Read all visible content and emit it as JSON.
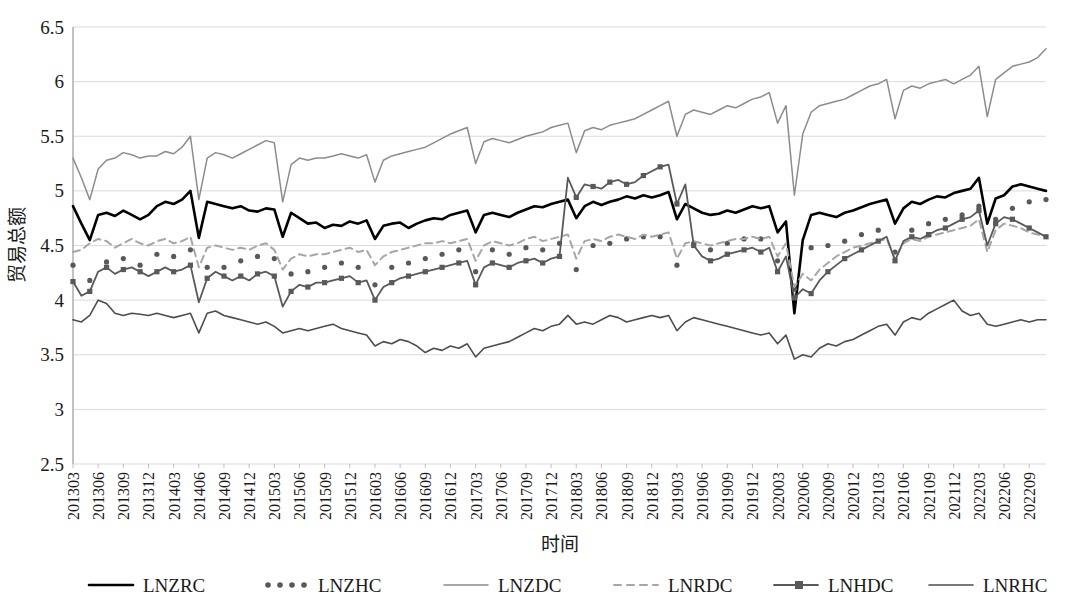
{
  "chart_data": {
    "type": "line",
    "title": "",
    "xlabel": "时间",
    "ylabel": "贸易总额",
    "ylim": [
      2.5,
      6.5
    ],
    "ytick_labels": [
      "6.5",
      "6",
      "5.5",
      "5",
      "4.5",
      "4",
      "3.5",
      "3",
      "2.5"
    ],
    "ytick_values": [
      6.5,
      6,
      5.5,
      5,
      4.5,
      4,
      3.5,
      3,
      2.5
    ],
    "grid": true,
    "legend_position": "bottom",
    "x_tick_labels": [
      "201303",
      "201306",
      "201309",
      "201312",
      "201403",
      "201406",
      "201409",
      "201412",
      "201503",
      "201506",
      "201509",
      "201512",
      "201603",
      "201606",
      "201609",
      "201612",
      "201703",
      "201706",
      "201709",
      "201712",
      "201803",
      "201806",
      "201809",
      "201812",
      "201903",
      "201906",
      "201909",
      "201912",
      "202003",
      "202006",
      "202009",
      "202012",
      "202103",
      "202106",
      "202109",
      "202112",
      "202203",
      "202206",
      "202209"
    ],
    "x_tick_step_months": 3,
    "x_start": "201303",
    "x_end": "202211",
    "n_points": 117,
    "series": [
      {
        "name": "LNZRC",
        "color": "#000000",
        "style": "solid",
        "width": 2.6,
        "marker": "none",
        "values": [
          4.86,
          4.7,
          4.55,
          4.78,
          4.8,
          4.77,
          4.82,
          4.78,
          4.74,
          4.78,
          4.86,
          4.9,
          4.88,
          4.92,
          5.0,
          4.57,
          4.9,
          4.88,
          4.86,
          4.84,
          4.86,
          4.82,
          4.81,
          4.84,
          4.83,
          4.58,
          4.8,
          4.75,
          4.7,
          4.71,
          4.66,
          4.69,
          4.68,
          4.72,
          4.7,
          4.73,
          4.56,
          4.68,
          4.7,
          4.71,
          4.66,
          4.7,
          4.73,
          4.75,
          4.74,
          4.78,
          4.8,
          4.82,
          4.62,
          4.78,
          4.8,
          4.78,
          4.76,
          4.8,
          4.83,
          4.86,
          4.85,
          4.88,
          4.9,
          4.92,
          4.75,
          4.86,
          4.9,
          4.87,
          4.9,
          4.92,
          4.95,
          4.93,
          4.96,
          4.94,
          4.96,
          4.99,
          4.74,
          4.88,
          4.84,
          4.8,
          4.78,
          4.79,
          4.82,
          4.8,
          4.83,
          4.86,
          4.84,
          4.86,
          4.62,
          4.72,
          3.88,
          4.55,
          4.78,
          4.8,
          4.78,
          4.76,
          4.8,
          4.82,
          4.85,
          4.88,
          4.9,
          4.92,
          4.7,
          4.84,
          4.9,
          4.88,
          4.92,
          4.95,
          4.94,
          4.98,
          5.0,
          5.02,
          5.12,
          4.7,
          4.93,
          4.96,
          5.04,
          5.06,
          5.04,
          5.02,
          5.0
        ]
      },
      {
        "name": "LNZHC",
        "color": "#595959",
        "style": "dotted",
        "width": 4.2,
        "marker": "dot",
        "values": [
          4.32,
          4.2,
          4.18,
          4.36,
          4.35,
          4.3,
          4.38,
          4.36,
          4.32,
          4.38,
          4.42,
          4.44,
          4.4,
          4.42,
          4.46,
          4.12,
          4.3,
          4.35,
          4.3,
          4.32,
          4.36,
          4.34,
          4.4,
          4.42,
          4.38,
          4.12,
          4.24,
          4.28,
          4.26,
          4.3,
          4.3,
          4.32,
          4.34,
          4.36,
          4.3,
          4.32,
          4.14,
          4.26,
          4.3,
          4.36,
          4.34,
          4.36,
          4.38,
          4.4,
          4.42,
          4.44,
          4.46,
          4.48,
          4.26,
          4.42,
          4.46,
          4.44,
          4.42,
          4.46,
          4.48,
          4.5,
          4.46,
          4.5,
          4.52,
          4.54,
          4.28,
          4.46,
          4.5,
          4.48,
          4.52,
          4.54,
          4.56,
          4.54,
          4.58,
          4.56,
          4.58,
          4.6,
          4.32,
          4.48,
          4.52,
          4.5,
          4.46,
          4.48,
          4.52,
          4.54,
          4.56,
          4.58,
          4.56,
          4.58,
          4.36,
          4.5,
          4.1,
          4.36,
          4.48,
          4.52,
          4.5,
          4.52,
          4.54,
          4.58,
          4.6,
          4.62,
          4.64,
          4.66,
          4.44,
          4.6,
          4.64,
          4.66,
          4.7,
          4.72,
          4.74,
          4.76,
          4.78,
          4.8,
          4.86,
          4.5,
          4.74,
          4.8,
          4.84,
          4.88,
          4.9,
          4.88,
          4.92
        ]
      },
      {
        "name": "LNZDC",
        "color": "#8c8c8c",
        "style": "solid",
        "width": 1.5,
        "marker": "none",
        "values": [
          5.3,
          5.12,
          4.92,
          5.2,
          5.28,
          5.3,
          5.35,
          5.33,
          5.3,
          5.32,
          5.32,
          5.36,
          5.34,
          5.4,
          5.5,
          4.92,
          5.3,
          5.35,
          5.33,
          5.3,
          5.34,
          5.38,
          5.42,
          5.46,
          5.44,
          4.9,
          5.24,
          5.3,
          5.28,
          5.3,
          5.3,
          5.32,
          5.34,
          5.32,
          5.3,
          5.33,
          5.08,
          5.28,
          5.32,
          5.34,
          5.36,
          5.38,
          5.4,
          5.44,
          5.48,
          5.52,
          5.55,
          5.58,
          5.25,
          5.45,
          5.48,
          5.46,
          5.44,
          5.47,
          5.5,
          5.52,
          5.54,
          5.58,
          5.6,
          5.62,
          5.35,
          5.55,
          5.58,
          5.56,
          5.6,
          5.62,
          5.64,
          5.66,
          5.7,
          5.74,
          5.78,
          5.82,
          5.5,
          5.7,
          5.74,
          5.72,
          5.7,
          5.74,
          5.78,
          5.76,
          5.8,
          5.84,
          5.86,
          5.9,
          5.62,
          5.78,
          4.96,
          5.52,
          5.72,
          5.78,
          5.8,
          5.82,
          5.84,
          5.88,
          5.92,
          5.96,
          5.98,
          6.02,
          5.66,
          5.92,
          5.96,
          5.94,
          5.98,
          6.0,
          6.02,
          5.98,
          6.02,
          6.06,
          6.14,
          5.68,
          6.02,
          6.08,
          6.14,
          6.16,
          6.18,
          6.22,
          6.3
        ]
      },
      {
        "name": "LNRDC",
        "color": "#a6a6a6",
        "style": "dashed",
        "width": 2.0,
        "marker": "none",
        "values": [
          4.44,
          4.46,
          4.52,
          4.56,
          4.54,
          4.48,
          4.52,
          4.56,
          4.52,
          4.5,
          4.54,
          4.56,
          4.52,
          4.54,
          4.58,
          4.3,
          4.48,
          4.5,
          4.48,
          4.46,
          4.48,
          4.46,
          4.5,
          4.52,
          4.46,
          4.28,
          4.38,
          4.42,
          4.4,
          4.42,
          4.42,
          4.44,
          4.46,
          4.48,
          4.44,
          4.46,
          4.32,
          4.4,
          4.44,
          4.46,
          4.48,
          4.5,
          4.52,
          4.52,
          4.54,
          4.52,
          4.54,
          4.56,
          4.36,
          4.5,
          4.54,
          4.52,
          4.5,
          4.52,
          4.56,
          4.58,
          4.54,
          4.56,
          4.58,
          4.6,
          4.38,
          4.54,
          4.56,
          4.54,
          4.58,
          4.6,
          4.58,
          4.56,
          4.6,
          4.58,
          4.6,
          4.62,
          4.38,
          4.52,
          4.54,
          4.52,
          4.5,
          4.52,
          4.54,
          4.56,
          4.56,
          4.58,
          4.56,
          4.58,
          4.4,
          4.52,
          4.12,
          4.24,
          4.18,
          4.28,
          4.34,
          4.4,
          4.44,
          4.48,
          4.5,
          4.52,
          4.54,
          4.56,
          4.38,
          4.52,
          4.56,
          4.54,
          4.58,
          4.6,
          4.62,
          4.64,
          4.66,
          4.68,
          4.74,
          4.44,
          4.64,
          4.7,
          4.68,
          4.66,
          4.62,
          4.6,
          4.58
        ]
      },
      {
        "name": "LNHDC",
        "color": "#595959",
        "style": "solid",
        "width": 1.8,
        "marker": "square",
        "values": [
          4.17,
          4.04,
          4.08,
          4.26,
          4.3,
          4.24,
          4.28,
          4.3,
          4.26,
          4.22,
          4.26,
          4.3,
          4.26,
          4.28,
          4.32,
          3.98,
          4.2,
          4.26,
          4.22,
          4.18,
          4.22,
          4.18,
          4.24,
          4.26,
          4.22,
          3.94,
          4.08,
          4.14,
          4.12,
          4.16,
          4.16,
          4.18,
          4.2,
          4.22,
          4.16,
          4.18,
          4.0,
          4.12,
          4.16,
          4.2,
          4.22,
          4.24,
          4.26,
          4.28,
          4.3,
          4.32,
          4.34,
          4.36,
          4.14,
          4.3,
          4.34,
          4.32,
          4.3,
          4.34,
          4.36,
          4.38,
          4.34,
          4.38,
          4.4,
          5.12,
          4.94,
          5.06,
          5.04,
          5.02,
          5.08,
          5.1,
          5.06,
          5.08,
          5.14,
          5.18,
          5.22,
          5.24,
          4.88,
          5.06,
          4.5,
          4.4,
          4.36,
          4.38,
          4.42,
          4.44,
          4.46,
          4.48,
          4.44,
          4.48,
          4.26,
          4.4,
          4.02,
          4.1,
          4.06,
          4.18,
          4.26,
          4.32,
          4.38,
          4.42,
          4.46,
          4.5,
          4.54,
          4.58,
          4.36,
          4.54,
          4.58,
          4.56,
          4.6,
          4.64,
          4.66,
          4.7,
          4.74,
          4.76,
          4.82,
          4.5,
          4.7,
          4.76,
          4.74,
          4.7,
          4.66,
          4.62,
          4.58
        ]
      },
      {
        "name": "LNRHC",
        "color": "#4d4d4d",
        "style": "solid",
        "width": 1.6,
        "marker": "none",
        "values": [
          3.82,
          3.8,
          3.86,
          4.0,
          3.97,
          3.88,
          3.86,
          3.88,
          3.87,
          3.86,
          3.88,
          3.86,
          3.84,
          3.86,
          3.88,
          3.7,
          3.88,
          3.9,
          3.86,
          3.84,
          3.82,
          3.8,
          3.78,
          3.8,
          3.76,
          3.7,
          3.72,
          3.74,
          3.72,
          3.74,
          3.76,
          3.78,
          3.74,
          3.72,
          3.7,
          3.68,
          3.58,
          3.62,
          3.6,
          3.64,
          3.62,
          3.58,
          3.52,
          3.56,
          3.54,
          3.58,
          3.56,
          3.6,
          3.48,
          3.56,
          3.58,
          3.6,
          3.62,
          3.66,
          3.7,
          3.74,
          3.72,
          3.76,
          3.78,
          3.86,
          3.78,
          3.8,
          3.78,
          3.82,
          3.86,
          3.84,
          3.8,
          3.82,
          3.84,
          3.86,
          3.84,
          3.86,
          3.72,
          3.8,
          3.84,
          3.82,
          3.8,
          3.78,
          3.76,
          3.74,
          3.72,
          3.7,
          3.68,
          3.7,
          3.6,
          3.68,
          3.46,
          3.5,
          3.48,
          3.56,
          3.6,
          3.58,
          3.62,
          3.64,
          3.68,
          3.72,
          3.76,
          3.78,
          3.68,
          3.8,
          3.84,
          3.82,
          3.88,
          3.92,
          3.96,
          4.0,
          3.9,
          3.86,
          3.88,
          3.78,
          3.76,
          3.78,
          3.8,
          3.82,
          3.8,
          3.82,
          3.82
        ]
      }
    ]
  },
  "legend": {
    "items": [
      {
        "label": "LNZRC"
      },
      {
        "label": "LNZHC"
      },
      {
        "label": "LNZDC"
      },
      {
        "label": "LNRDC"
      },
      {
        "label": "LNHDC"
      },
      {
        "label": "LNRHC"
      }
    ]
  }
}
